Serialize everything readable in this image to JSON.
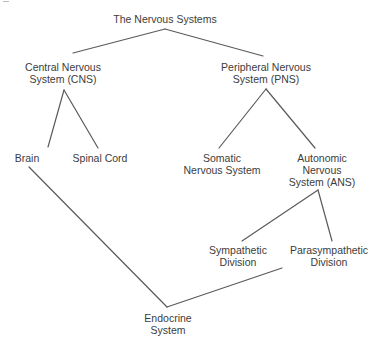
{
  "diagram": {
    "title": "The Nervous Systems",
    "nodes": {
      "root": {
        "lines": [
          "The Nervous Systems"
        ]
      },
      "cns": {
        "lines": [
          "Central Nervous",
          "System (CNS)"
        ]
      },
      "pns": {
        "lines": [
          "Peripheral Nervous",
          "System (PNS)"
        ]
      },
      "brain": {
        "lines": [
          "Brain"
        ]
      },
      "spinal_cord": {
        "lines": [
          "Spinal Cord"
        ]
      },
      "somatic": {
        "lines": [
          "Somatic",
          "Nervous System"
        ]
      },
      "ans": {
        "lines": [
          "Autonomic",
          "Nervous",
          "System (ANS)"
        ]
      },
      "sympathetic": {
        "lines": [
          "Sympathetic",
          "Division"
        ]
      },
      "parasympathetic": {
        "lines": [
          "Parasympathetic",
          "Division"
        ]
      },
      "endocrine": {
        "lines": [
          "Endocrine",
          "System"
        ]
      }
    },
    "edges": [
      {
        "from": "The Nervous Systems",
        "to": "Central Nervous System (CNS)"
      },
      {
        "from": "The Nervous Systems",
        "to": "Peripheral Nervous System (PNS)"
      },
      {
        "from": "Central Nervous System (CNS)",
        "to": "Brain"
      },
      {
        "from": "Central Nervous System (CNS)",
        "to": "Spinal Cord"
      },
      {
        "from": "Peripheral Nervous System (PNS)",
        "to": "Somatic Nervous System"
      },
      {
        "from": "Peripheral Nervous System (PNS)",
        "to": "Autonomic Nervous System (ANS)"
      },
      {
        "from": "Autonomic Nervous System (ANS)",
        "to": "Sympathetic Division"
      },
      {
        "from": "Autonomic Nervous System (ANS)",
        "to": "Parasympathetic Division"
      },
      {
        "from": "Brain",
        "to": "Endocrine System"
      },
      {
        "from": "Parasympathetic Division",
        "to": "Endocrine System"
      }
    ],
    "colors": {
      "line": "#5a5a5a",
      "text": "#3c3c3c",
      "background": "#ffffff"
    }
  }
}
